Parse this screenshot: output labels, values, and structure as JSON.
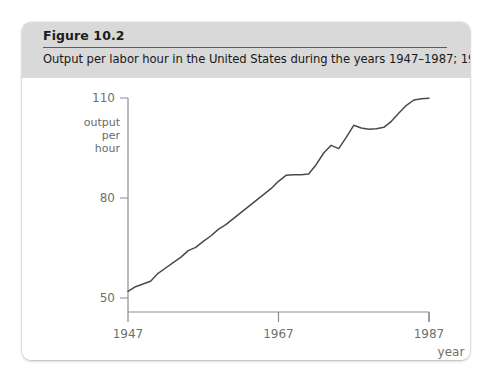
{
  "figure": {
    "number_label": "Figure 10.2",
    "caption": "Output per labor hour in the United States during the years 1947–1987; 1977 = 100."
  },
  "chart_data": {
    "type": "line",
    "title": "",
    "xlabel": "year",
    "ylabel": "output per hour",
    "ylabel_lines": [
      "output",
      "per",
      "hour"
    ],
    "xlim": [
      1947,
      1987
    ],
    "ylim": [
      50,
      110
    ],
    "xticks": [
      1947,
      1967,
      1987
    ],
    "xtick_labels": [
      "1947",
      "1967",
      "1987"
    ],
    "yticks": [
      50,
      80,
      110
    ],
    "ytick_labels": [
      "50",
      "80",
      "110"
    ],
    "grid": false,
    "legend": null,
    "line_color": "#4a4a4a",
    "axis_color": "#8c8c8c",
    "series": [
      {
        "name": "Output per labor hour",
        "x": [
          1947,
          1948,
          1949,
          1950,
          1951,
          1952,
          1953,
          1954,
          1955,
          1956,
          1957,
          1958,
          1959,
          1960,
          1961,
          1962,
          1963,
          1964,
          1965,
          1966,
          1967,
          1968,
          1969,
          1970,
          1971,
          1972,
          1973,
          1974,
          1975,
          1976,
          1977,
          1978,
          1979,
          1980,
          1981,
          1982,
          1983,
          1984,
          1985,
          1986,
          1987
        ],
        "y": [
          52.0,
          53.4,
          54.2,
          55.0,
          57.4,
          59.0,
          60.6,
          62.2,
          64.2,
          65.2,
          67.0,
          68.6,
          70.6,
          72.0,
          73.8,
          75.6,
          77.4,
          79.2,
          81.0,
          82.8,
          85.0,
          86.8,
          87.0,
          87.0,
          87.2,
          90.0,
          93.5,
          95.8,
          94.8,
          98.2,
          101.8,
          101.0,
          100.6,
          100.8,
          101.2,
          103.0,
          105.5,
          107.8,
          109.4,
          109.8,
          109.9
        ]
      }
    ]
  },
  "colors": {
    "card_background": "#ffffff",
    "header_band": "#d9d9d9",
    "page_background": "#ffffff",
    "text": "#181818",
    "line": "#4a4a4a"
  }
}
